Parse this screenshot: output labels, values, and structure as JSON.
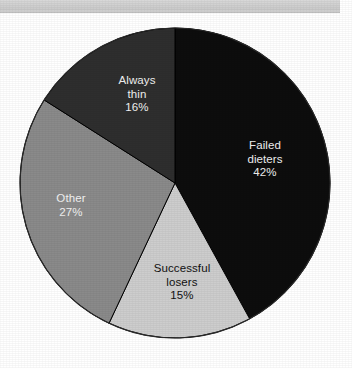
{
  "figure": {
    "background_color": "#ffffff",
    "banner_color": "#d2d2d2"
  },
  "chart_data": {
    "type": "pie",
    "title": "",
    "subtitle": "",
    "xlabel": "",
    "ylabel": "",
    "legend_position": "none",
    "grid": false,
    "labels_inside_slices": true,
    "start_angle_deg": 0,
    "direction": "clockwise",
    "categories": [
      "Failed dieters",
      "Successful losers",
      "Other",
      "Always thin"
    ],
    "values": [
      42,
      15,
      27,
      16
    ],
    "value_suffix": "%",
    "colors": [
      "#0d0d0d",
      "#cdcdcd",
      "#8a8a8a",
      "#2e2e2e"
    ],
    "slices": [
      {
        "name": "failed-dieters",
        "label_line1": "Failed",
        "label_line2": "dieters",
        "value_label": "42%",
        "value": 42,
        "color": "#0d0d0d",
        "text_color": "#f2f2f2",
        "start_deg": 0,
        "end_deg": 151.2
      },
      {
        "name": "successful-losers",
        "label_line1": "Successful",
        "label_line2": "losers",
        "value_label": "15%",
        "value": 15,
        "color": "#cdcdcd",
        "text_color": "#111111",
        "start_deg": 151.2,
        "end_deg": 205.2
      },
      {
        "name": "other",
        "label_line1": "Other",
        "label_line2": "",
        "value_label": "27%",
        "value": 27,
        "color": "#8a8a8a",
        "text_color": "#f2f2f2",
        "start_deg": 205.2,
        "end_deg": 302.4
      },
      {
        "name": "always-thin",
        "label_line1": "Always",
        "label_line2": "thin",
        "value_label": "16%",
        "value": 16,
        "color": "#2e2e2e",
        "text_color": "#f2f2f2",
        "start_deg": 302.4,
        "end_deg": 360
      }
    ],
    "geometry": {
      "center_x": 175,
      "center_y": 183,
      "radius": 155
    }
  }
}
